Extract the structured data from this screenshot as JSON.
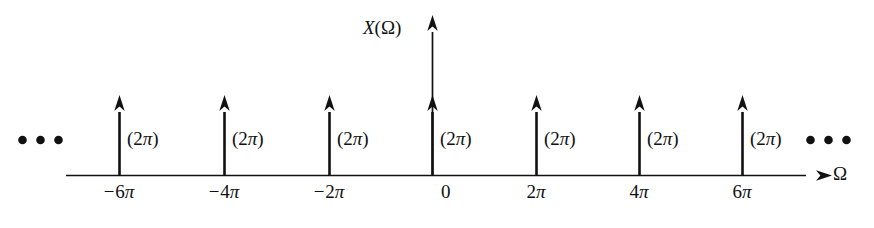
{
  "figure": {
    "title_axis_y": "X(Ω)",
    "axis_x_label": "Ω",
    "origin_label": "0",
    "ellipsis_left": "• • •",
    "ellipsis_right": "• • •",
    "line_color": "#111111",
    "background_color": "#ffffff"
  },
  "chart_data": {
    "type": "line",
    "title": "",
    "xlabel": "Ω",
    "ylabel": "X(Ω)",
    "grid": false,
    "legend": "none",
    "x_tick_labels": [
      "−6π",
      "−4π",
      "−2π",
      "0",
      "2π",
      "4π",
      "6π"
    ],
    "x": [
      -6.283185,
      -4.18879,
      -2.094395,
      0,
      2.094395,
      4.18879,
      6.283185
    ],
    "impulse_area_label": "(2π)",
    "impulse_labels": [
      "(2π)",
      "(2π)",
      "(2π)",
      "(2π)",
      "(2π)",
      "(2π)",
      "(2π)"
    ],
    "values": [
      6.283185,
      6.283185,
      6.283185,
      6.283185,
      6.283185,
      6.283185,
      6.283185
    ],
    "continues_left": true,
    "continues_right": true,
    "annotation": "Periodic impulse train of strength 2π spaced at multiples of 2π"
  },
  "impulses": [
    {
      "tick": "−6π",
      "amplitude": "(2π)",
      "x": 119
    },
    {
      "tick": "−4π",
      "amplitude": "(2π)",
      "x": 224
    },
    {
      "tick": "−2π",
      "amplitude": "(2π)",
      "x": 329
    },
    {
      "tick": "0",
      "amplitude": "(2π)",
      "x": 432
    },
    {
      "tick": "2π",
      "amplitude": "(2π)",
      "x": 536
    },
    {
      "tick": "4π",
      "amplitude": "(2π)",
      "x": 639
    },
    {
      "tick": "6π",
      "amplitude": "(2π)",
      "x": 742
    }
  ]
}
